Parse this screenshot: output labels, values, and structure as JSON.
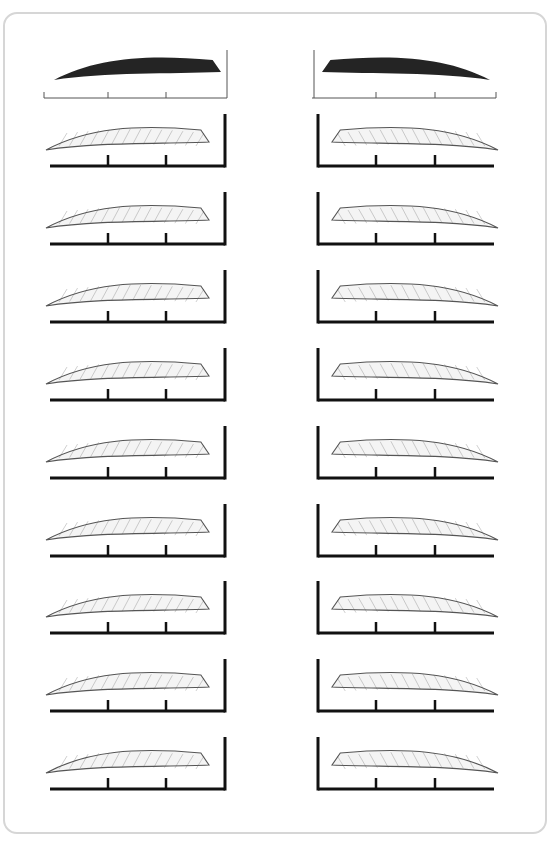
{
  "worksheet": {
    "title": "",
    "layout": {
      "rows": 10,
      "columns": 2
    },
    "colors": {
      "border": "#d6d6d6",
      "guide": "#111111",
      "reference_fill": "#111111",
      "sketch": "#555555"
    },
    "left_column": {
      "side": "left",
      "reference_row_y": 80,
      "row_ys": [
        150,
        228,
        306,
        384,
        462,
        540,
        617,
        695,
        773
      ],
      "guide_x_start": 50,
      "guide_x_end": 225,
      "tick_xs": [
        108,
        166
      ]
    },
    "right_column": {
      "side": "right",
      "reference_row_y": 80,
      "row_ys": [
        150,
        228,
        306,
        384,
        462,
        540,
        617,
        695,
        773
      ],
      "guide_x_start": 318,
      "guide_x_end": 494,
      "tick_xs": [
        376,
        435
      ]
    }
  }
}
